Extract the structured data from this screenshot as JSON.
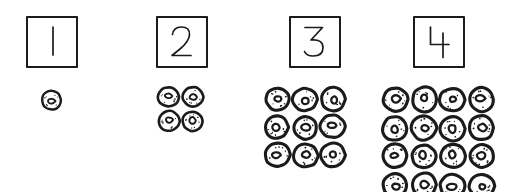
{
  "figure": {
    "title": "Square numbers shown as square arrays of cells",
    "background_color": "#ffffff",
    "ink_color": "#1b1b1b",
    "cell_fill_color": "#ffffff",
    "panel_count": 4
  },
  "panels": [
    {
      "label": "1",
      "side_length": 1,
      "rows": 1,
      "columns": 1,
      "cell_count": 1,
      "box": {
        "x": 26,
        "y": 16,
        "width": 52,
        "height": 52
      },
      "grid": {
        "x": 40,
        "y": 89,
        "width": 22,
        "height": 22,
        "cell_size": 22
      }
    },
    {
      "label": "2",
      "side_length": 2,
      "rows": 2,
      "columns": 2,
      "cell_count": 4,
      "box": {
        "x": 156,
        "y": 16,
        "width": 52,
        "height": 52
      },
      "grid": {
        "x": 157,
        "y": 85,
        "width": 48,
        "height": 48,
        "cell_size": 24
      }
    },
    {
      "label": "3",
      "side_length": 3,
      "rows": 3,
      "columns": 3,
      "cell_count": 9,
      "box": {
        "x": 289,
        "y": 16,
        "width": 52,
        "height": 52
      },
      "grid": {
        "x": 263,
        "y": 85,
        "width": 84,
        "height": 72,
        "cell_size": 26
      }
    },
    {
      "label": "4",
      "side_length": 4,
      "rows": 4,
      "columns": 4,
      "cell_count": 16,
      "box": {
        "x": 413,
        "y": 16,
        "width": 52,
        "height": 52
      },
      "grid": {
        "x": 381,
        "y": 85,
        "width": 114,
        "height": 100,
        "cell_size": 27
      }
    }
  ],
  "chart_data": {
    "type": "bar",
    "title": "Square numbers shown as square arrays of cells",
    "xlabel": "",
    "ylabel": "",
    "categories": [
      "1",
      "2",
      "3",
      "4"
    ],
    "values": [
      1,
      4,
      9,
      16
    ],
    "series": [
      {
        "name": "cells in array",
        "values": [
          1,
          4,
          9,
          16
        ]
      },
      {
        "name": "array side length",
        "values": [
          1,
          2,
          3,
          4
        ]
      }
    ],
    "annotations": [
      "1 x 1 = 1 cell",
      "2 x 2 = 4 cells",
      "3 x 3 = 9 cells",
      "4 x 4 = 16 cells"
    ],
    "grid": false,
    "legend": "none"
  }
}
